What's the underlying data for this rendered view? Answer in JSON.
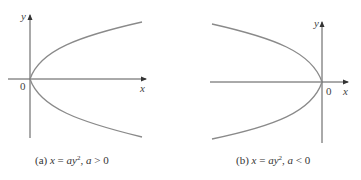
{
  "figure_a": {
    "axis_labels": {
      "x": "x",
      "y": "y",
      "origin": "0"
    },
    "caption": {
      "tag": "(a)",
      "lhs": "x",
      "eq": " = ",
      "coef": "ay",
      "exp": "2",
      "sep": ", ",
      "cond_var": "a",
      "cond": " > 0"
    }
  },
  "figure_b": {
    "axis_labels": {
      "x": "x",
      "y": "y",
      "origin": "0"
    },
    "caption": {
      "tag": "(b)",
      "lhs": "x",
      "eq": " = ",
      "coef": "ay",
      "exp": "2",
      "sep": ", ",
      "cond_var": "a",
      "cond": " < 0"
    }
  },
  "colors": {
    "axis": "#555555",
    "curve": "#8a8a8a",
    "text": "#444444"
  }
}
